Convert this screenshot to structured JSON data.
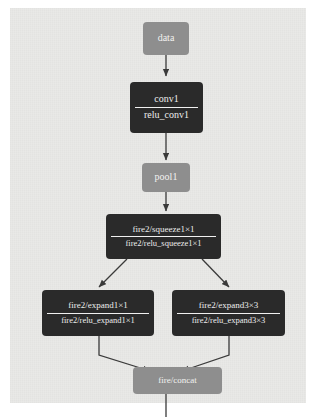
{
  "diagram": {
    "background_color": "#e9e9e7",
    "node_gray_color": "#8e8e8e",
    "node_dark_color": "#2a2a2a",
    "edge_color": "#3a3a3a",
    "nodes": [
      {
        "id": "data",
        "kind": "gray",
        "lines": [
          "data"
        ]
      },
      {
        "id": "conv1",
        "kind": "dark",
        "lines": [
          "conv1",
          "relu_conv1"
        ]
      },
      {
        "id": "pool1",
        "kind": "gray",
        "lines": [
          "pool1"
        ]
      },
      {
        "id": "fire2_squeeze",
        "kind": "dark",
        "lines": [
          "fire2/squeeze1×1",
          "fire2/relu_squeeze1×1"
        ]
      },
      {
        "id": "fire2_expand1x1",
        "kind": "dark",
        "lines": [
          "fire2/expand1×1",
          "fire2/relu_expand1×1"
        ]
      },
      {
        "id": "fire2_expand3x3",
        "kind": "dark",
        "lines": [
          "fire2/expand3×3",
          "fire2/relu_expand3×3"
        ]
      },
      {
        "id": "fire_concat",
        "kind": "gray",
        "lines": [
          "fire/concat"
        ]
      }
    ],
    "edges": [
      {
        "from": "data",
        "to": "conv1",
        "style": "arrow"
      },
      {
        "from": "conv1",
        "to": "pool1",
        "style": "arrow"
      },
      {
        "from": "pool1",
        "to": "fire2_squeeze",
        "style": "arrow"
      },
      {
        "from": "fire2_squeeze",
        "to": "fire2_expand1x1",
        "style": "arrow"
      },
      {
        "from": "fire2_squeeze",
        "to": "fire2_expand3x3",
        "style": "arrow"
      },
      {
        "from": "fire2_expand1x1",
        "to": "fire_concat",
        "style": "arrow"
      },
      {
        "from": "fire2_expand3x3",
        "to": "fire_concat",
        "style": "arrow"
      },
      {
        "from": "fire_concat",
        "to": "below",
        "style": "line"
      }
    ]
  }
}
